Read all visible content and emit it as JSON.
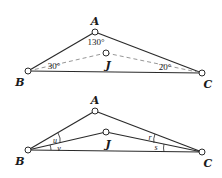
{
  "colors": {
    "stroke": "#2a2a2a",
    "dashed": "#8a8a8a",
    "background": "#ffffff"
  },
  "top_diagram": {
    "points": {
      "A": {
        "label": "A",
        "x": 95,
        "y": 32
      },
      "B": {
        "label": "B",
        "x": 28,
        "y": 71
      },
      "C": {
        "label": "C",
        "x": 202,
        "y": 73
      },
      "J": {
        "label": "J",
        "x": 106,
        "y": 53
      }
    },
    "angles": {
      "A": "130°",
      "B": "30°",
      "C": "20°"
    }
  },
  "bottom_diagram": {
    "points": {
      "A": {
        "label": "A",
        "x": 95,
        "y": 111
      },
      "B": {
        "label": "B",
        "x": 28,
        "y": 150
      },
      "C": {
        "label": "C",
        "x": 202,
        "y": 152
      },
      "J": {
        "label": "J",
        "x": 106,
        "y": 132
      }
    },
    "angles": {
      "u": "u",
      "v": "v",
      "r": "r",
      "s": "s"
    }
  }
}
